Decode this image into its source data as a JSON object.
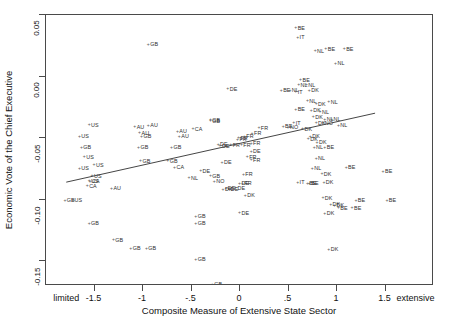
{
  "chart_data": {
    "type": "scatter",
    "title": "",
    "subtitle": "",
    "xlabel": "Composite Measure of Extensive State Sector",
    "ylabel": "Economic Vote of the Chief Executive",
    "xlim": [
      -2.0,
      2.0
    ],
    "ylim": [
      -0.17,
      0.05
    ],
    "grid": false,
    "legend": null,
    "xticks": [
      {
        "value": -1.78,
        "label": "limited"
      },
      {
        "value": -1.5,
        "label": "-1.5"
      },
      {
        "value": -1.0,
        "label": "-1"
      },
      {
        "value": -0.5,
        "label": "-.5"
      },
      {
        "value": 0.0,
        "label": "0"
      },
      {
        "value": 0.5,
        "label": ".5"
      },
      {
        "value": 1.0,
        "label": "1"
      },
      {
        "value": 1.5,
        "label": "1.5"
      },
      {
        "value": 1.82,
        "label": "extensive"
      }
    ],
    "yticks": [
      {
        "value": 0.05,
        "label": "0.05"
      },
      {
        "value": 0.0,
        "label": "0.00"
      },
      {
        "value": -0.05,
        "label": "-0.05"
      },
      {
        "value": -0.1,
        "label": "-0.10"
      },
      {
        "value": -0.15,
        "label": "-0.15"
      }
    ],
    "marker": "plus-small",
    "point_color": "#3a3a3a",
    "line_color": "#444444",
    "fit_line": {
      "type": "linear",
      "x_start": -1.79,
      "y_start": -0.0867,
      "x_end": 1.41,
      "y_end": -0.0303
    },
    "points": [
      {
        "label": "US",
        "x": -1.55,
        "y": -0.0385
      },
      {
        "label": "GB",
        "x": -0.94,
        "y": 0.0268
      },
      {
        "label": "AU",
        "x": -1.08,
        "y": -0.0403
      },
      {
        "label": "AU",
        "x": -0.94,
        "y": -0.039
      },
      {
        "label": "AU",
        "x": -1.03,
        "y": -0.045
      },
      {
        "label": "AU",
        "x": -0.64,
        "y": -0.044
      },
      {
        "label": "AU",
        "x": -0.62,
        "y": -0.0478
      },
      {
        "label": "GB",
        "x": -1.01,
        "y": -0.0478
      },
      {
        "label": "US",
        "x": -1.65,
        "y": -0.0478
      },
      {
        "label": "GB",
        "x": -1.63,
        "y": -0.0568
      },
      {
        "label": "GB",
        "x": -1.04,
        "y": -0.057
      },
      {
        "label": "GB",
        "x": -0.7,
        "y": -0.057
      },
      {
        "label": "US",
        "x": -1.6,
        "y": -0.0648
      },
      {
        "label": "GB",
        "x": -1.02,
        "y": -0.068
      },
      {
        "label": "GB",
        "x": -0.74,
        "y": -0.0678
      },
      {
        "label": "US",
        "x": -1.5,
        "y": -0.071
      },
      {
        "label": "US",
        "x": -1.65,
        "y": -0.074
      },
      {
        "label": "CA",
        "x": -0.67,
        "y": -0.073
      },
      {
        "label": "US",
        "x": -1.52,
        "y": -0.08
      },
      {
        "label": "CA",
        "x": -1.57,
        "y": -0.088
      },
      {
        "label": "AU",
        "x": -1.32,
        "y": -0.09
      },
      {
        "label": "US",
        "x": -1.55,
        "y": -0.084
      },
      {
        "label": "CA",
        "x": -1.54,
        "y": -0.0845
      },
      {
        "label": "GB",
        "x": -1.8,
        "y": -0.1
      },
      {
        "label": "US",
        "x": -1.72,
        "y": -0.1
      },
      {
        "label": "GB",
        "x": -1.55,
        "y": -0.1185
      },
      {
        "label": "GB",
        "x": -1.3,
        "y": -0.132
      },
      {
        "label": "GB",
        "x": -1.12,
        "y": -0.139
      },
      {
        "label": "GB",
        "x": -0.96,
        "y": -0.139
      },
      {
        "label": "CA",
        "x": -0.48,
        "y": -0.042
      },
      {
        "label": "DE",
        "x": -0.12,
        "y": -0.0095
      },
      {
        "label": "GB",
        "x": -0.3,
        "y": -0.0345
      },
      {
        "label": "GB",
        "x": -0.3,
        "y": -0.0352
      },
      {
        "label": "FR",
        "x": -0.01,
        "y": -0.049
      },
      {
        "label": "FR",
        "x": 0.05,
        "y": -0.048
      },
      {
        "label": "FR",
        "x": -0.02,
        "y": -0.0505
      },
      {
        "label": "FR",
        "x": 0.13,
        "y": -0.0455
      },
      {
        "label": "FR",
        "x": 0.2,
        "y": -0.041
      },
      {
        "label": "FR",
        "x": 0.12,
        "y": -0.0535
      },
      {
        "label": "DE",
        "x": -0.22,
        "y": -0.0545
      },
      {
        "label": "DE",
        "x": -0.2,
        "y": -0.0555
      },
      {
        "label": "FR",
        "x": -0.09,
        "y": -0.055
      },
      {
        "label": "FR",
        "x": 0.02,
        "y": -0.0548
      },
      {
        "label": "DE",
        "x": 0.12,
        "y": -0.06
      },
      {
        "label": "FR",
        "x": 0.08,
        "y": -0.0645
      },
      {
        "label": "FR",
        "x": 0.12,
        "y": -0.0672
      },
      {
        "label": "DE",
        "x": -0.18,
        "y": -0.069
      },
      {
        "label": "DE",
        "x": -0.4,
        "y": -0.076
      },
      {
        "label": "FR",
        "x": 0.04,
        "y": -0.079
      },
      {
        "label": "NL",
        "x": -0.52,
        "y": -0.0815
      },
      {
        "label": "GB",
        "x": -0.3,
        "y": -0.08
      },
      {
        "label": "NO",
        "x": -0.26,
        "y": -0.0845
      },
      {
        "label": "DE",
        "x": 0.0,
        "y": -0.086
      },
      {
        "label": "FR",
        "x": 0.03,
        "y": -0.0862
      },
      {
        "label": "DE",
        "x": -0.14,
        "y": -0.09
      },
      {
        "label": "DE",
        "x": -0.11,
        "y": -0.0905
      },
      {
        "label": "DK",
        "x": -0.17,
        "y": -0.091
      },
      {
        "label": "DE",
        "x": -0.04,
        "y": -0.0898
      },
      {
        "label": "DK",
        "x": 0.06,
        "y": -0.096
      },
      {
        "label": "DE",
        "x": 0.0,
        "y": -0.11
      },
      {
        "label": "GB",
        "x": -0.45,
        "y": -0.113
      },
      {
        "label": "GB",
        "x": -0.45,
        "y": -0.1185
      },
      {
        "label": "GB",
        "x": -0.45,
        "y": -0.148
      },
      {
        "label": "BE",
        "x": 0.58,
        "y": 0.04
      },
      {
        "label": "IT",
        "x": 0.6,
        "y": 0.0325
      },
      {
        "label": "BE",
        "x": 0.89,
        "y": 0.023
      },
      {
        "label": "BE",
        "x": 1.08,
        "y": 0.023
      },
      {
        "label": "NL",
        "x": 0.78,
        "y": 0.0215
      },
      {
        "label": "NL",
        "x": 0.99,
        "y": 0.0115
      },
      {
        "label": "BE",
        "x": 0.63,
        "y": -0.002
      },
      {
        "label": "NL",
        "x": 0.61,
        "y": -0.006
      },
      {
        "label": "NL",
        "x": 0.69,
        "y": -0.006
      },
      {
        "label": "BE",
        "x": 0.43,
        "y": -0.0105
      },
      {
        "label": "NL",
        "x": 0.52,
        "y": -0.0105
      },
      {
        "label": "IT",
        "x": 0.58,
        "y": -0.012
      },
      {
        "label": "DK",
        "x": 0.72,
        "y": -0.0105
      },
      {
        "label": "NL",
        "x": 0.7,
        "y": -0.019
      },
      {
        "label": "DK",
        "x": 0.79,
        "y": -0.0215
      },
      {
        "label": "NL",
        "x": 0.92,
        "y": -0.02
      },
      {
        "label": "BE",
        "x": 0.58,
        "y": -0.0262
      },
      {
        "label": "DK",
        "x": 0.74,
        "y": -0.0268
      },
      {
        "label": "NL",
        "x": 0.83,
        "y": -0.0282
      },
      {
        "label": "DK",
        "x": 0.76,
        "y": -0.032
      },
      {
        "label": "NL",
        "x": 0.88,
        "y": -0.034
      },
      {
        "label": "IT",
        "x": 0.56,
        "y": -0.037
      },
      {
        "label": "DK",
        "x": 0.79,
        "y": -0.0372
      },
      {
        "label": "NO",
        "x": 0.86,
        "y": -0.037
      },
      {
        "label": "BE",
        "x": 0.45,
        "y": -0.04
      },
      {
        "label": "NO",
        "x": 0.5,
        "y": -0.0405
      },
      {
        "label": "DK",
        "x": 0.65,
        "y": -0.042
      },
      {
        "label": "NL",
        "x": 0.95,
        "y": -0.034
      },
      {
        "label": "NL",
        "x": 1.02,
        "y": -0.039
      },
      {
        "label": "DK",
        "x": 0.73,
        "y": -0.048
      },
      {
        "label": "DK",
        "x": 0.71,
        "y": -0.05
      },
      {
        "label": "DK",
        "x": 0.8,
        "y": -0.053
      },
      {
        "label": "NL",
        "x": 0.77,
        "y": -0.057
      },
      {
        "label": "BE",
        "x": 0.88,
        "y": -0.0568
      },
      {
        "label": "NL",
        "x": 0.79,
        "y": -0.066
      },
      {
        "label": "BE",
        "x": 1.1,
        "y": -0.073
      },
      {
        "label": "NL",
        "x": 0.75,
        "y": -0.074
      },
      {
        "label": "DK",
        "x": 0.85,
        "y": -0.0785
      },
      {
        "label": "IT",
        "x": 0.6,
        "y": -0.0855
      },
      {
        "label": "BE",
        "x": 0.72,
        "y": -0.086
      },
      {
        "label": "BE",
        "x": 0.7,
        "y": -0.0862
      },
      {
        "label": "DK",
        "x": 0.87,
        "y": -0.0855
      },
      {
        "label": "DK",
        "x": 0.86,
        "y": -0.098
      },
      {
        "label": "DK",
        "x": 0.94,
        "y": -0.103
      },
      {
        "label": "DK",
        "x": 0.98,
        "y": -0.104
      },
      {
        "label": "BE",
        "x": 1.2,
        "y": -0.1
      },
      {
        "label": "BE",
        "x": 1.16,
        "y": -0.106
      },
      {
        "label": "BE",
        "x": 1.02,
        "y": -0.106
      },
      {
        "label": "DK",
        "x": 0.88,
        "y": -0.1105
      },
      {
        "label": "BE",
        "x": 1.48,
        "y": -0.0765
      },
      {
        "label": "BE",
        "x": 1.52,
        "y": -0.1
      },
      {
        "label": "DK",
        "x": 0.92,
        "y": -0.1395
      },
      {
        "label": "GB",
        "x": -0.28,
        "y": -0.168
      }
    ]
  },
  "x_axis": {
    "title": "Composite Measure of Extensive State Sector"
  },
  "y_axis": {
    "title": "Economic Vote of the Chief Executive"
  }
}
